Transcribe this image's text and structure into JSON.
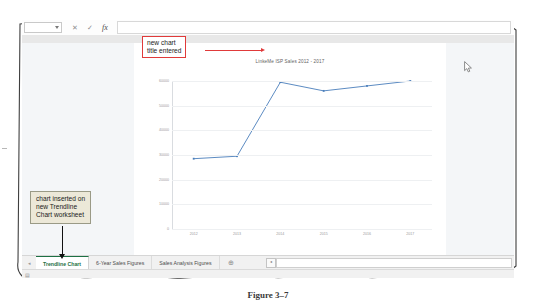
{
  "figure": {
    "caption": "Figure 3–7"
  },
  "excel": {
    "formula_bar": {
      "name_box_value": "",
      "cancel_icon": "✕",
      "enter_icon": "✓",
      "function_icon": "fx",
      "formula_value": ""
    },
    "sheet_tabs": [
      {
        "label": "Trendline Chart",
        "active": true
      },
      {
        "label": "6-Year Sales Figures",
        "active": false
      },
      {
        "label": "Sales Analysis Figures",
        "active": false
      }
    ],
    "add_sheet_label": "⊕",
    "tab_scroll_left_icon": "◂",
    "hscroll_left_icon": "◂",
    "status_icon": "▤"
  },
  "annotations": [
    {
      "id": "new-chart-title",
      "text": "new chart\ntitle entered",
      "line1": "new chart",
      "line2": "title entered",
      "style": "red-box"
    },
    {
      "id": "chart-inserted",
      "text": "chart inserted on new Trendline Chart worksheet",
      "line1": "chart inserted on",
      "line2": "new Trendline",
      "line3": "Chart worksheet",
      "style": "tan-box"
    }
  ],
  "colors": {
    "series_line": "#4a7ebb",
    "callout_red": "#e03a3a",
    "callout_tan_bg": "#ece8d8",
    "active_tab_text": "#1d7044",
    "gridline": "#eef0f2"
  },
  "chart_data": {
    "type": "line",
    "title": "LinkeMe ISP Sales 2012 - 2017",
    "xlabel": "",
    "ylabel": "",
    "categories": [
      "2012",
      "2013",
      "2014",
      "2015",
      "2016",
      "2017"
    ],
    "series": [
      {
        "name": "LinkeMe ISP Sales",
        "values": [
          28500,
          29500,
          59500,
          56000,
          58000,
          60000
        ],
        "color": "#4a7ebb"
      }
    ],
    "ylim": [
      0,
      60000
    ],
    "yticks": [
      0,
      10000,
      20000,
      30000,
      40000,
      50000,
      60000
    ],
    "ytick_labels": [
      "0",
      "10000",
      "20000",
      "30000",
      "40000",
      "50000",
      "60000"
    ],
    "grid": true,
    "legend": false,
    "markers": true
  }
}
